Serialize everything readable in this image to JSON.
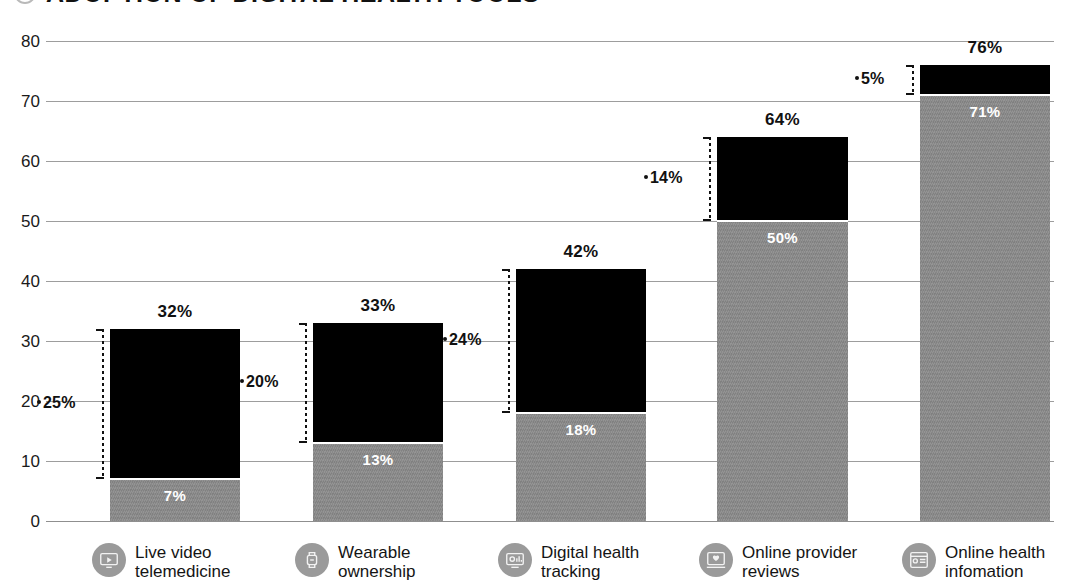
{
  "header": {
    "title": "ADOPTION OF DIGITAL HEALTH TOOLS",
    "bullet_icon": "circle-bullet-icon",
    "dot_icons": [
      "dot-icon",
      "dot-icon"
    ]
  },
  "colors": {
    "top_segment": "#000000",
    "bottom_segment": "#8b8b8b",
    "gridline": "#9d9d9d",
    "text": "#111111",
    "segment_label": "#ffffff",
    "icon_circle": "#9a9a9a"
  },
  "chart_data": {
    "type": "bar",
    "title": "ADOPTION OF DIGITAL HEALTH TOOLS",
    "xlabel": "",
    "ylabel": "",
    "ylim": [
      0,
      80
    ],
    "yticks": [
      0,
      10,
      20,
      30,
      40,
      50,
      60,
      70,
      80
    ],
    "ytick_labels": [
      "0",
      "10",
      "20",
      "30",
      "40",
      "50",
      "60",
      "70",
      "80"
    ],
    "grid": true,
    "legend": "none",
    "stacked": true,
    "categories": [
      "Live video\ntelemedicine",
      "Wearable\nownership",
      "Digital health\ntracking",
      "Online provider\nreviews",
      "Online health\ninfomation"
    ],
    "series": [
      {
        "name": "current",
        "values": [
          7,
          13,
          18,
          50,
          71
        ]
      },
      {
        "name": "growth",
        "values": [
          25,
          20,
          24,
          14,
          5
        ]
      }
    ],
    "totals": [
      32,
      33,
      42,
      64,
      76
    ],
    "total_labels": [
      "32%",
      "33%",
      "42%",
      "64%",
      "76%"
    ],
    "bottom_labels": [
      "7%",
      "13%",
      "18%",
      "50%",
      "71%"
    ],
    "bracket_labels": [
      "25%",
      "20%",
      "24%",
      "14%",
      "5%"
    ]
  },
  "bars": [
    {
      "category_label": "Live video\ntelemedicine",
      "icon": "telemedicine-monitor-icon",
      "total_label": "32%",
      "bottom_label": "7%",
      "bracket_label": "25%",
      "total": 32,
      "bottom": 7,
      "top": 25,
      "x": 110,
      "width": 130,
      "bracket_x": 94,
      "bracket_label_x": 37
    },
    {
      "category_label": "Wearable\nownership",
      "icon": "wearable-watch-icon",
      "total_label": "33%",
      "bottom_label": "13%",
      "bracket_label": "20%",
      "total": 33,
      "bottom": 13,
      "top": 20,
      "x": 313,
      "width": 130,
      "bracket_x": 297,
      "bracket_label_x": 240
    },
    {
      "category_label": "Digital health\ntracking",
      "icon": "digital-tracking-icon",
      "total_label": "42%",
      "bottom_label": "18%",
      "bracket_label": "24%",
      "total": 42,
      "bottom": 18,
      "top": 24,
      "x": 516,
      "width": 130,
      "bracket_x": 500,
      "bracket_label_x": 443
    },
    {
      "category_label": "Online provider\nreviews",
      "icon": "provider-reviews-icon",
      "total_label": "64%",
      "bottom_label": "50%",
      "bracket_label": "14%",
      "total": 64,
      "bottom": 50,
      "top": 14,
      "x": 717,
      "width": 131,
      "bracket_x": 701,
      "bracket_label_x": 644
    },
    {
      "category_label": "Online health\ninfomation",
      "icon": "health-information-icon",
      "total_label": "76%",
      "bottom_label": "71%",
      "bracket_label": "5%",
      "total": 76,
      "bottom": 71,
      "top": 5,
      "x": 920,
      "width": 130,
      "bracket_x": 904,
      "bracket_label_x": 855
    }
  ]
}
